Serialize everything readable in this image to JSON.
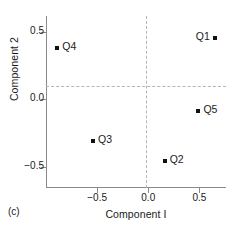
{
  "caption": "(c)",
  "chart_data": {
    "type": "scatter",
    "title": "",
    "xlabel": "Component I",
    "ylabel": "Component 2",
    "xlim": [
      -1.0,
      0.76
    ],
    "ylim": [
      -0.66,
      0.62
    ],
    "xticks": [
      -0.5,
      0.0,
      0.5
    ],
    "xticklabels": [
      "−0.5",
      "0.0",
      "0.5"
    ],
    "yticks": [
      0.5,
      0.0,
      -0.5
    ],
    "yticklabels": [
      "0.5",
      "0.0",
      "−0.5"
    ],
    "grid": false,
    "zero_lines": {
      "horizontal": 0.0,
      "vertical": 0.0,
      "style": "dashed"
    },
    "legend": "none",
    "marker": {
      "shape": "square",
      "color": "#111111",
      "size": 4
    },
    "points": [
      {
        "label": "Q1",
        "x": 0.65,
        "y": 0.46,
        "label_side": "left"
      },
      {
        "label": "Q2",
        "x": 0.16,
        "y": -0.46,
        "label_side": "right"
      },
      {
        "label": "Q3",
        "x": -0.54,
        "y": -0.31,
        "label_side": "right"
      },
      {
        "label": "Q4",
        "x": -0.89,
        "y": 0.38,
        "label_side": "right"
      },
      {
        "label": "Q5",
        "x": 0.49,
        "y": -0.09,
        "label_side": "right"
      }
    ]
  }
}
